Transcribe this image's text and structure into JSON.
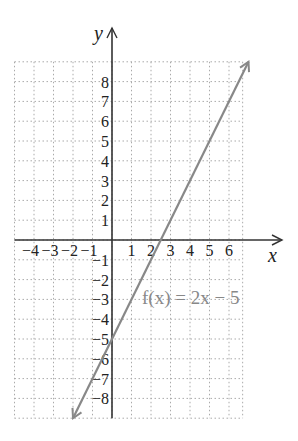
{
  "chart_data": {
    "type": "line",
    "title": "",
    "xlabel": "x",
    "ylabel": "y",
    "xlim": [
      -5,
      7
    ],
    "ylim": [
      -9,
      9
    ],
    "grid": true,
    "x_tick_labels": [
      "−4",
      "−3",
      "−2",
      "−1",
      "1",
      "2",
      "3",
      "4",
      "5",
      "6"
    ],
    "y_tick_labels": [
      "8",
      "7",
      "6",
      "5",
      "4",
      "3",
      "2",
      "1",
      "−1",
      "−2",
      "−3",
      "−4",
      "−5",
      "−6",
      "−7",
      "−8"
    ],
    "series": [
      {
        "name": "f(x) = 2x − 5",
        "x": [
          -2,
          7
        ],
        "y": [
          -9,
          9
        ],
        "color": "#888888"
      }
    ],
    "annotation": "f(x) = 2x − 5"
  },
  "labels": {
    "x_axis": "x",
    "y_axis": "y",
    "function": "f(x) = 2x − 5"
  }
}
